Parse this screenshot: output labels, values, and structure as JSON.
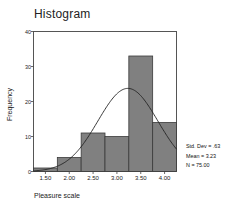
{
  "chart_data": {
    "type": "bar",
    "title": "Histogram",
    "xlabel": "Pleasure scale",
    "ylabel": "Frequency",
    "xlim": [
      1.25,
      4.25
    ],
    "ylim": [
      0,
      40
    ],
    "grid": false,
    "bar_color": "#808080",
    "bar_edge_color": "#3a3a3a",
    "curve_color": "#222222",
    "bin_width": 0.5,
    "bin_edges": [
      1.25,
      1.75,
      2.25,
      2.75,
      3.25,
      3.75,
      4.25
    ],
    "categories": [
      "1.25-1.75",
      "1.75-2.25",
      "2.25-2.75",
      "2.75-3.25",
      "3.25-3.75",
      "3.75-4.25"
    ],
    "values": [
      1,
      4,
      11,
      10,
      33,
      14
    ],
    "xticks": [
      1.5,
      2.0,
      2.5,
      3.0,
      3.5,
      4.0
    ],
    "xticklabels": [
      "1.50",
      "2.00",
      "2.50",
      "3.00",
      "3.50",
      "4.00"
    ],
    "yticks": [
      0,
      10,
      20,
      30,
      40
    ],
    "yticklabels": [
      "0",
      "10",
      "20",
      "30",
      "40"
    ],
    "overlay": {
      "type": "normal-curve",
      "mean": 3.23,
      "std_dev": 0.63,
      "n": 75
    },
    "annotations": [
      "Std. Dev = .63",
      "Mean = 3.23",
      "N = 75.00"
    ]
  },
  "stats": {
    "std_dev": "Std. Dev = .63",
    "mean": "Mean = 3.23",
    "n": "N = 75.00"
  }
}
